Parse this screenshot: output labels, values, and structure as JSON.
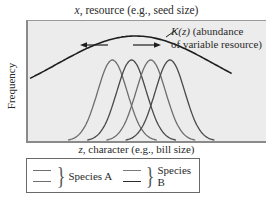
{
  "title_top": {
    "var": "x,",
    "text": " resource (e.g., seed size)"
  },
  "y_axis_label": "Frequency",
  "x_axis_label": {
    "var": "z,",
    "text": " character (e.g., bill size)"
  },
  "k_curve_label": {
    "symbol": "K(z)",
    "line1": " (abundance",
    "line2": "of variable resource)"
  },
  "arrows": [
    "left",
    "right"
  ],
  "species_curves": [
    {
      "species": "A",
      "peak_position": 0.36
    },
    {
      "species": "B",
      "peak_position": 0.44
    },
    {
      "species": "A",
      "peak_position": 0.52
    },
    {
      "species": "B",
      "peak_position": 0.6
    }
  ],
  "legend": {
    "items": [
      {
        "label": "Species A",
        "line_colors": [
          "#6e6e6e",
          "#6e6e6e"
        ]
      },
      {
        "label": "Species B",
        "line_colors": [
          "#7a7a7a",
          "#3a3a3a"
        ]
      }
    ]
  },
  "colors": {
    "k_curve": "#1e1e1e",
    "species_a": "#6e6e6e",
    "species_b": "#4a4a4a",
    "panel_bg": "#ececec"
  }
}
